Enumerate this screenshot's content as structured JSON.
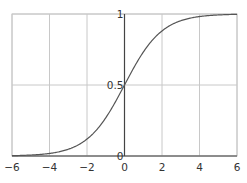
{
  "chart_data": {
    "type": "line",
    "title": "",
    "xlabel": "",
    "ylabel": "",
    "xlim": [
      -6,
      6
    ],
    "ylim": [
      0,
      1
    ],
    "grid": true,
    "legend": null,
    "function": "sigmoid: 1/(1+e^-x)",
    "x_ticks": [
      -6,
      -4,
      -2,
      0,
      2,
      4,
      6
    ],
    "x_tick_labels": [
      "−6",
      "−4",
      "−2",
      "0",
      "2",
      "4",
      "6"
    ],
    "y_ticks": [
      0,
      0.5,
      1
    ],
    "y_tick_labels": [
      "0",
      "0.5",
      "1"
    ],
    "series": [
      {
        "name": "sigmoid",
        "color": "#555555",
        "x": [
          -6,
          -5,
          -4,
          -3,
          -2,
          -1,
          0,
          1,
          2,
          3,
          4,
          5,
          6
        ],
        "y": [
          0.0025,
          0.0067,
          0.018,
          0.047,
          0.119,
          0.269,
          0.5,
          0.731,
          0.881,
          0.953,
          0.982,
          0.9933,
          0.9975
        ]
      }
    ]
  },
  "colors": {
    "grid": "#c8c8c8",
    "axis": "#444444",
    "curve": "#555555",
    "frame": "#c8c8c8"
  }
}
